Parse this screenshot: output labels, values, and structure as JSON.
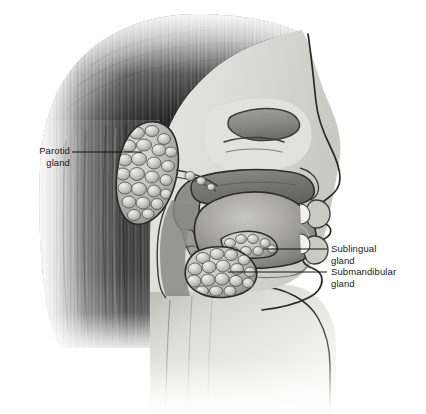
{
  "figure": {
    "width": 426,
    "height": 414,
    "background_color": "#ffffff"
  },
  "labels": [
    {
      "id": "parotid",
      "name": "parotid-gland-label",
      "line1": "Parotid",
      "line2": "gland",
      "side": "left",
      "leader_line": {
        "x1": 72,
        "y1": 152,
        "x2": 142,
        "y2": 152
      }
    },
    {
      "id": "sublingual",
      "name": "sublingual-gland-label",
      "line1": "Sublingual",
      "line2": "gland",
      "side": "right",
      "leader_line": {
        "x1": 263,
        "y1": 249,
        "x2": 327,
        "y2": 249
      }
    },
    {
      "id": "submandibular",
      "name": "submandibular-gland-label",
      "line1": "Submandibular",
      "line2": "gland",
      "side": "right",
      "leader_line": {
        "x1": 228,
        "y1": 272,
        "x2": 327,
        "y2": 272
      }
    }
  ],
  "structures": {
    "hair": "hair",
    "face_skin": "face-skin",
    "nasal_cavity": "nasal-cavity",
    "turbinates": "nasal-turbinates",
    "hard_palate": "hard-palate",
    "soft_palate": "soft-palate",
    "tongue": "tongue",
    "lips": "lips",
    "teeth": "teeth",
    "mandible": "mandible",
    "pharynx": "pharynx",
    "neck": "neck",
    "parotid_gland": "parotid-gland",
    "parotid_duct": "parotid-duct",
    "sublingual_gland": "sublingual-gland",
    "submandibular_gland": "submandibular-gland"
  },
  "colors": {
    "text": "#1a1a1a",
    "leader_line": "#111111",
    "outline": "#2b2b2b",
    "hair_dark": "#1c1c1c",
    "hair_mid": "#6e6e6e",
    "skin_light": "#d8d8d4",
    "skin_mid": "#c2c2bd",
    "gland_light": "#cfcfcb",
    "gland_mid": "#a8a8a4",
    "tongue_mid": "#9a9a96",
    "tongue_dark": "#6f6f6c",
    "cavity_dark": "#7b7b78",
    "background": "#ffffff"
  }
}
